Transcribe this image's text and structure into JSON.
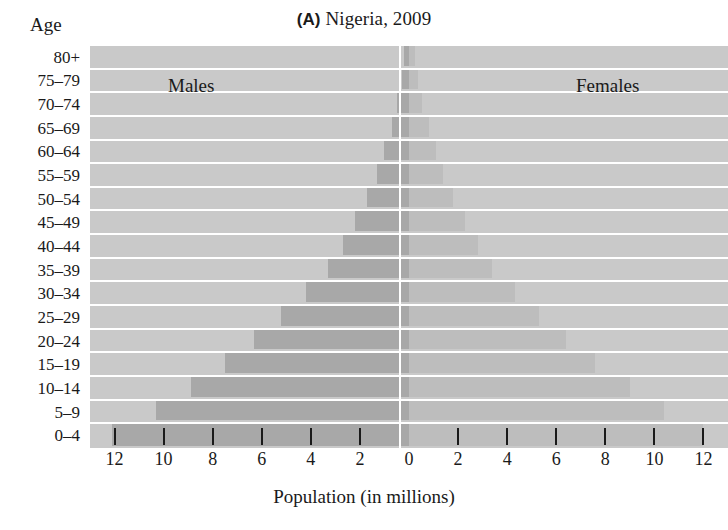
{
  "figure": {
    "panel_letter": "(A)",
    "title_text": "Nigeria, 2009",
    "age_caption": "Age",
    "males_label": "Males",
    "females_label": "Females",
    "xaxis_title": "Population (in millions)"
  },
  "chart_data": {
    "type": "bar",
    "subtype": "population-pyramid",
    "title": "(A) Nigeria, 2009",
    "xlabel": "Population (in millions)",
    "ylabel": "Age",
    "xlim": [
      -13,
      13
    ],
    "xtick_labels": [
      "12",
      "10",
      "8",
      "6",
      "4",
      "2",
      "0",
      "2",
      "4",
      "6",
      "8",
      "10",
      "12"
    ],
    "xtick_values": [
      -12,
      -10,
      -8,
      -6,
      -4,
      -2,
      0,
      2,
      4,
      6,
      8,
      10,
      12
    ],
    "grid": false,
    "legend_position": "in-plot",
    "categories": [
      "80+",
      "75–79",
      "70–74",
      "65–69",
      "60–64",
      "55–59",
      "50–54",
      "45–49",
      "40–44",
      "35–39",
      "30–34",
      "25–29",
      "20–24",
      "15–19",
      "10–14",
      "5–9",
      "0–4"
    ],
    "series": [
      {
        "name": "Males",
        "color": "#a8a8a8",
        "values": [
          0.2,
          0.3,
          0.5,
          0.7,
          1.0,
          1.3,
          1.7,
          2.2,
          2.7,
          3.3,
          4.2,
          5.2,
          6.3,
          7.5,
          8.9,
          10.3,
          12.1
        ]
      },
      {
        "name": "Females",
        "color": "#bdbdbd",
        "values": [
          0.25,
          0.35,
          0.55,
          0.8,
          1.1,
          1.4,
          1.8,
          2.3,
          2.8,
          3.4,
          4.3,
          5.3,
          6.4,
          7.6,
          9.0,
          10.4,
          12.0
        ]
      }
    ]
  },
  "style": {
    "plot_background": "#c9c9c9",
    "male_bar_color": "#a8a8a8",
    "female_bar_color": "#bdbdbd",
    "separator_color": "#ffffff",
    "text_color": "#1a1a1a"
  }
}
